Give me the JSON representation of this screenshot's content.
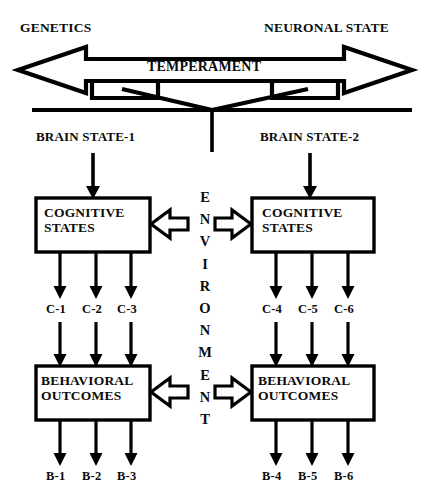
{
  "diagram": {
    "title_top_left": "GENETICS",
    "title_top_right": "NEURONAL STATE",
    "temperament_label": "TEMPERAMENT",
    "environment_label": "ENVIRONMENT",
    "environment_letters": [
      "E",
      "N",
      "V",
      "I",
      "R",
      "O",
      "N",
      "M",
      "E",
      "N",
      "T"
    ],
    "branches": [
      {
        "brain_state": "BRAIN STATE-1",
        "cognitive_box": [
          "COGNITIVE",
          "STATES"
        ],
        "cognitive_nodes": [
          "C-1",
          "C-2",
          "C-3"
        ],
        "behavioral_box": [
          "BEHAVIORAL",
          "OUTCOMES"
        ],
        "behavioral_nodes": [
          "B-1",
          "B-2",
          "B-3"
        ]
      },
      {
        "brain_state": "BRAIN STATE-2",
        "cognitive_box": [
          "COGNITIVE",
          "STATES"
        ],
        "cognitive_nodes": [
          "C-4",
          "C-5",
          "C-6"
        ],
        "behavioral_box": [
          "BEHAVIORAL",
          "OUTCOMES"
        ],
        "behavioral_nodes": [
          "B-4",
          "B-5",
          "B-6"
        ]
      }
    ],
    "colors": {
      "stroke": "#000000",
      "text": "#0b0b0b",
      "background": "#ffffff"
    }
  }
}
